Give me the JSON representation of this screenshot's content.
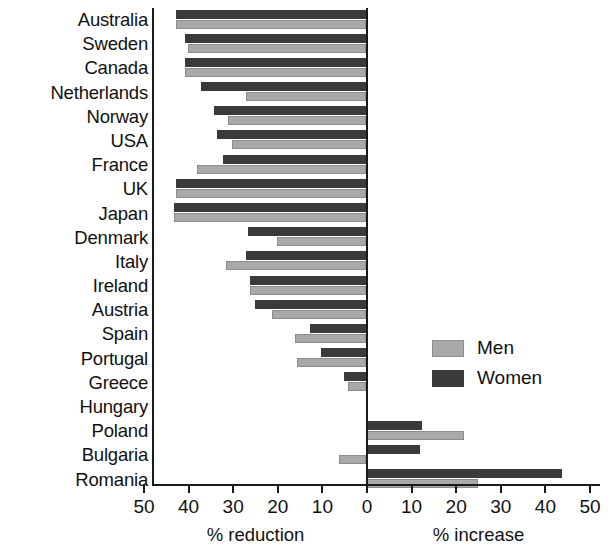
{
  "chart_data": {
    "type": "bar",
    "orientation": "horizontal",
    "title": "",
    "xlabel_left": "% reduction",
    "xlabel_right": "% increase",
    "ylabel": "",
    "grid": false,
    "legend_position": "center-right",
    "axis": {
      "min": -50,
      "max": 50,
      "tick_values": [
        -50,
        -40,
        -30,
        -20,
        -10,
        0,
        10,
        20,
        30,
        40,
        50
      ],
      "tick_labels": [
        "50",
        "40",
        "30",
        "20",
        "10",
        "0",
        "10",
        "20",
        "30",
        "40",
        "50"
      ],
      "zero_at": 0,
      "note": "Values left of zero are reductions (plotted as negative), right of zero are increases"
    },
    "categories": [
      "Australia",
      "Sweden",
      "Canada",
      "Netherlands",
      "Norway",
      "USA",
      "France",
      "UK",
      "Japan",
      "Denmark",
      "Italy",
      "Ireland",
      "Austria",
      "Spain",
      "Portugal",
      "Greece",
      "Hungary",
      "Poland",
      "Bulgaria",
      "Romania"
    ],
    "series": [
      {
        "name": "Men",
        "color": "#a9a9a9",
        "values": [
          -42.5,
          -40.0,
          -40.5,
          -27.0,
          -31.0,
          -30.0,
          -38.0,
          -42.5,
          -43.0,
          -20.0,
          -31.5,
          -26.0,
          -21.0,
          -16.0,
          -15.5,
          -4.0,
          0,
          22.0,
          -6.0,
          25.0
        ]
      },
      {
        "name": "Women",
        "color": "#3a3a3a",
        "values": [
          -42.5,
          -40.5,
          -40.5,
          -37.0,
          -34.0,
          -33.5,
          -32.0,
          -42.5,
          -43.0,
          -26.5,
          -27.0,
          -26.0,
          -25.0,
          -12.5,
          -10.0,
          -5.0,
          0,
          12.5,
          12.0,
          44.0
        ]
      }
    ]
  },
  "legend": {
    "items": [
      {
        "label": "Men",
        "key": "men"
      },
      {
        "label": "Women",
        "key": "women"
      }
    ]
  }
}
